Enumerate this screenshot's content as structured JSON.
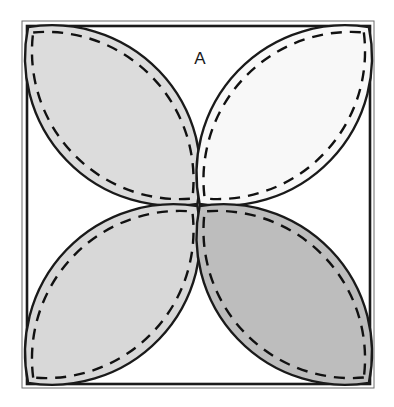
{
  "figure": {
    "label": "A",
    "label_position": {
      "x": 200,
      "y": 60
    },
    "background_color": "#ffffff",
    "frame": {
      "name": "outer-square-frame",
      "x": 22,
      "y": 21,
      "width": 352,
      "height": 367,
      "outer_stroke_color": "#6d6d6d",
      "outer_stroke_width": 1,
      "inner_x": 27,
      "inner_y": 26,
      "inner_width": 343,
      "inner_height": 358,
      "inner_stroke_color": "#1a1a1a",
      "inner_stroke_width": 2.6,
      "fill": "#ffffff"
    },
    "center": {
      "x": 198.5,
      "y": 205
    },
    "petals": [
      {
        "name": "petal-top-left",
        "corner": "top-left",
        "fill": "#dcdcdc",
        "solid_stroke_color": "#1a1a1a",
        "solid_stroke_width": 2.4,
        "dash_stroke_color": "#111111",
        "dash_stroke_width": 2.4,
        "dash_pattern": "11 8",
        "dash_inset": 7
      },
      {
        "name": "petal-top-right",
        "corner": "top-right",
        "fill": "#f8f8f8",
        "solid_stroke_color": "#1a1a1a",
        "solid_stroke_width": 2.4,
        "dash_stroke_color": "#111111",
        "dash_stroke_width": 2.4,
        "dash_pattern": "11 8",
        "dash_inset": 7
      },
      {
        "name": "petal-bottom-left",
        "corner": "bottom-left",
        "fill": "#d8d8d8",
        "solid_stroke_color": "#1a1a1a",
        "solid_stroke_width": 2.4,
        "dash_stroke_color": "#111111",
        "dash_stroke_width": 2.4,
        "dash_pattern": "11 8",
        "dash_inset": 7
      },
      {
        "name": "petal-bottom-right",
        "corner": "bottom-right",
        "fill": "#bdbdbd",
        "solid_stroke_color": "#1a1a1a",
        "solid_stroke_width": 2.4,
        "dash_stroke_color": "#111111",
        "dash_stroke_width": 2.4,
        "dash_pattern": "11 8",
        "dash_inset": 7
      }
    ]
  }
}
